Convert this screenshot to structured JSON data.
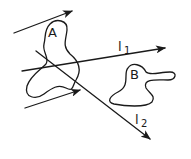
{
  "diagram": {
    "colors": {
      "stroke": "#1a1a1a",
      "background": "#ffffff"
    },
    "regions": [
      {
        "id": "A",
        "label": "A"
      },
      {
        "id": "B",
        "label": "B"
      }
    ],
    "lines": [
      {
        "id": "l1",
        "label_main": "l",
        "label_sub": "1"
      },
      {
        "id": "l2",
        "label_main": "l",
        "label_sub": "2"
      }
    ],
    "arrows": [
      {
        "id": "top-arrow"
      },
      {
        "id": "bottom-arrow"
      }
    ]
  }
}
